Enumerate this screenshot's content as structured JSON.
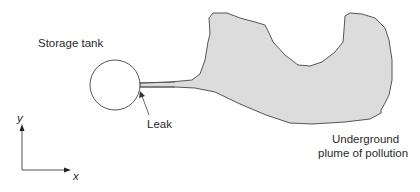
{
  "diagram": {
    "labels": {
      "storage_tank": "Storage tank",
      "leak": "Leak",
      "plume_line1": "Underground",
      "plume_line2": "plume of pollution",
      "axis_y": "y",
      "axis_x": "x"
    },
    "colors": {
      "plume_fill": "#dcdcdc",
      "stroke": "#555555",
      "background": "#ffffff"
    }
  }
}
